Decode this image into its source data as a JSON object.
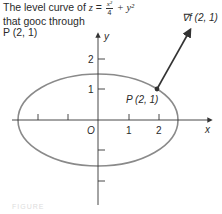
{
  "title": {
    "line1_prefix": "The level curve of ",
    "z": "z",
    "eq": " = ",
    "frac_num": "x²",
    "frac_den": "4",
    "plus": " + y²",
    "line2": "that gooc through",
    "line3": "P (2, 1)"
  },
  "diagram": {
    "gradient_label": "∇f (2, 1)",
    "point_label": "P (2, 1)",
    "x_axis_label": "x",
    "y_axis_label": "y",
    "origin_label": "O",
    "x_ticks": [
      "1",
      "2"
    ],
    "y_ticks": [
      "2",
      "1"
    ],
    "curve_color": "#8a8a8a",
    "axis_color": "#333333"
  },
  "caption": "FIGURE"
}
